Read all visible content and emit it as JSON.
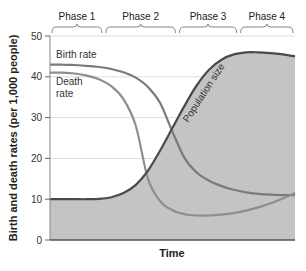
{
  "chart_data": {
    "type": "line",
    "title": "",
    "xlabel": "Time",
    "ylabel": "Birth and death rates (per 1,000 people)",
    "ylim": [
      0,
      50
    ],
    "yticks": [
      0,
      10,
      20,
      30,
      40,
      50
    ],
    "grid": true,
    "phases": [
      "Phase 1",
      "Phase 2",
      "Phase 3",
      "Phase 4"
    ],
    "phase_bounds": [
      0,
      0.22,
      0.52,
      0.77,
      1.0
    ],
    "x": [
      0,
      0.05,
      0.1,
      0.15,
      0.2,
      0.25,
      0.3,
      0.35,
      0.4,
      0.45,
      0.5,
      0.55,
      0.6,
      0.65,
      0.7,
      0.75,
      0.8,
      0.85,
      0.9,
      0.95,
      1.0
    ],
    "series": [
      {
        "name": "Birth rate",
        "label": "Birth rate",
        "values": [
          43,
          43,
          42.9,
          42.7,
          42.4,
          41.9,
          41.1,
          39.8,
          37.5,
          33.5,
          26.5,
          20,
          16.5,
          14.5,
          13.2,
          12.3,
          11.7,
          11.3,
          11.1,
          11.0,
          11.0
        ],
        "color": "#7a7a7a"
      },
      {
        "name": "Death rate",
        "label": "Death rate",
        "values": [
          41,
          41,
          40.8,
          40.3,
          39.4,
          37.7,
          34.5,
          28,
          15,
          9.5,
          7.3,
          6.3,
          6.0,
          6.0,
          6.2,
          6.6,
          7.2,
          8.0,
          9.0,
          10.2,
          11.5
        ],
        "color": "#8c8c8c"
      },
      {
        "name": "Population size",
        "label": "Population size",
        "values": [
          10,
          10,
          10,
          10,
          10.1,
          10.5,
          11.5,
          13.5,
          17,
          22,
          27.5,
          33,
          38,
          41.8,
          44.2,
          45.5,
          46,
          46,
          45.8,
          45.5,
          45
        ],
        "color": "#4a4a4a",
        "fill": "#c4c4c4"
      }
    ],
    "annotations": [
      "Birth rate",
      "Death rate",
      "Population size"
    ]
  }
}
